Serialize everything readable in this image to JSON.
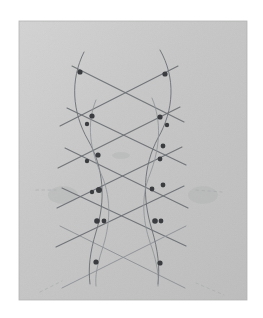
{
  "image": {
    "kind": "photograph-of-pencil-sketch",
    "width": 263,
    "height": 318,
    "caption": "Hand-drawn pencil diagram of a diagonal lattice (diagrid) with marked intersection nodes and two pairs of curved vertical lines"
  },
  "colors": {
    "background": "#ffffff",
    "paper_light": "#cfd0cf",
    "paper_mid": "#c3c4c3",
    "paper_shadow": "#b7b8b7",
    "paper_edge": "#aaabaa",
    "pencil_dark": "#4a4c50",
    "pencil_mid": "#6d7075",
    "pencil_light": "#8f9297",
    "pencil_faint": "#a6a8ac",
    "node_fill": "#3a3c40",
    "smudge": "#b0b1b2"
  },
  "paper": {
    "name": "gray-paper-sheet",
    "x": 19,
    "y": 21,
    "width": 228,
    "height": 279
  },
  "drawing": {
    "title": "lattice-sketch",
    "left_column_x": 92,
    "right_column_x": 165,
    "top_y": 72,
    "bottom_y": 265,
    "node_count": 18,
    "diagonal_line_count": 10,
    "curve_count": 4
  },
  "nodes": [
    {
      "id": "n-top-left",
      "x": 80,
      "y": 72,
      "r": 2.6
    },
    {
      "id": "n-top-right",
      "x": 165,
      "y": 74,
      "r": 2.6
    },
    {
      "id": "n-l2-a",
      "x": 92,
      "y": 116,
      "r": 2.6
    },
    {
      "id": "n-l2-b",
      "x": 87,
      "y": 124,
      "r": 2.2
    },
    {
      "id": "n-r2-a",
      "x": 160,
      "y": 117,
      "r": 2.6
    },
    {
      "id": "n-r2-b",
      "x": 167,
      "y": 125,
      "r": 2.2
    },
    {
      "id": "n-l3-a",
      "x": 98,
      "y": 155,
      "r": 2.6
    },
    {
      "id": "n-l3-b",
      "x": 87,
      "y": 161,
      "r": 2.2
    },
    {
      "id": "n-r3-a",
      "x": 163,
      "y": 146,
      "r": 2.4
    },
    {
      "id": "n-r3-b",
      "x": 160,
      "y": 159,
      "r": 2.4
    },
    {
      "id": "n-l4-a",
      "x": 99,
      "y": 190,
      "r": 3.0
    },
    {
      "id": "n-l4-b",
      "x": 92,
      "y": 192,
      "r": 2.2
    },
    {
      "id": "n-r4-a",
      "x": 152,
      "y": 189,
      "r": 2.4
    },
    {
      "id": "n-r4-b",
      "x": 163,
      "y": 185,
      "r": 2.4
    },
    {
      "id": "n-l5-a",
      "x": 97,
      "y": 221,
      "r": 2.8
    },
    {
      "id": "n-l5-b",
      "x": 104,
      "y": 221,
      "r": 2.4
    },
    {
      "id": "n-r5-a",
      "x": 155,
      "y": 221,
      "r": 2.8
    },
    {
      "id": "n-r5-b",
      "x": 161,
      "y": 221,
      "r": 2.4
    },
    {
      "id": "n-bot-left",
      "x": 96,
      "y": 262,
      "r": 2.6
    },
    {
      "id": "n-bot-right",
      "x": 160,
      "y": 263,
      "r": 2.6
    }
  ],
  "diagonals": [
    {
      "id": "d-down-1",
      "x1": 72,
      "y1": 66,
      "x2": 184,
      "y2": 122,
      "weight": 1.1,
      "tone": "pencil_mid"
    },
    {
      "id": "d-down-2",
      "x1": 67,
      "y1": 108,
      "x2": 186,
      "y2": 165,
      "weight": 1.1,
      "tone": "pencil_mid"
    },
    {
      "id": "d-down-3",
      "x1": 65,
      "y1": 148,
      "x2": 188,
      "y2": 208,
      "weight": 1.1,
      "tone": "pencil_mid"
    },
    {
      "id": "d-down-4",
      "x1": 62,
      "y1": 188,
      "x2": 186,
      "y2": 246,
      "weight": 1.1,
      "tone": "pencil_mid"
    },
    {
      "id": "d-down-5",
      "x1": 60,
      "y1": 226,
      "x2": 185,
      "y2": 288,
      "weight": 1.0,
      "tone": "pencil_light"
    },
    {
      "id": "d-up-1",
      "x1": 60,
      "y1": 126,
      "x2": 178,
      "y2": 66,
      "weight": 1.1,
      "tone": "pencil_mid"
    },
    {
      "id": "d-up-2",
      "x1": 58,
      "y1": 168,
      "x2": 180,
      "y2": 107,
      "weight": 1.1,
      "tone": "pencil_mid"
    },
    {
      "id": "d-up-3",
      "x1": 57,
      "y1": 208,
      "x2": 182,
      "y2": 147,
      "weight": 1.1,
      "tone": "pencil_mid"
    },
    {
      "id": "d-up-4",
      "x1": 56,
      "y1": 247,
      "x2": 184,
      "y2": 186,
      "weight": 1.1,
      "tone": "pencil_mid"
    },
    {
      "id": "d-up-5",
      "x1": 62,
      "y1": 288,
      "x2": 186,
      "y2": 226,
      "weight": 1.0,
      "tone": "pencil_light"
    }
  ],
  "curves": [
    {
      "id": "c-left-outer",
      "d": "M 84 52 C 70 80 72 112 88 140 C 104 168 106 200 96 232 C 90 252 88 268 90 284",
      "weight": 1.0,
      "tone": "pencil_mid"
    },
    {
      "id": "c-left-inner",
      "d": "M 96 100 C 86 124 90 150 102 176 C 112 200 110 226 102 250 C 97 266 95 276 96 286",
      "weight": 0.9,
      "tone": "pencil_light"
    },
    {
      "id": "c-right-outer",
      "d": "M 160 50 C 176 78 174 110 158 138 C 143 166 142 198 152 230 C 158 250 160 268 158 284",
      "weight": 1.0,
      "tone": "pencil_mid"
    },
    {
      "id": "c-right-inner",
      "d": "M 152 98 C 162 122 160 148 150 174 C 140 198 143 224 152 248 C 157 264 159 275 158 286",
      "weight": 0.9,
      "tone": "pencil_light"
    }
  ],
  "construction_marks": [
    {
      "id": "m-left-smudge",
      "x": 48,
      "y": 186,
      "w": 30,
      "h": 18
    },
    {
      "id": "m-right-smudge",
      "x": 188,
      "y": 186,
      "w": 30,
      "h": 18
    },
    {
      "id": "m-center-tick",
      "x": 112,
      "y": 152,
      "w": 18,
      "h": 7
    }
  ],
  "dashes": [
    {
      "id": "dash-bottom-left",
      "x1": 40,
      "y1": 292,
      "x2": 62,
      "y2": 281
    },
    {
      "id": "dash-bottom-right",
      "x1": 196,
      "y1": 283,
      "x2": 224,
      "y2": 295
    },
    {
      "id": "dash-mid-left",
      "x1": 36,
      "y1": 190,
      "x2": 56,
      "y2": 190
    },
    {
      "id": "dash-mid-right",
      "x1": 196,
      "y1": 190,
      "x2": 222,
      "y2": 192
    }
  ]
}
